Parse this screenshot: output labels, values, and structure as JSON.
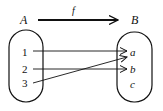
{
  "diagram": {
    "function_label": "f",
    "domain_label": "A",
    "codomain_label": "B",
    "domain_elements": [
      "1",
      "2",
      "3"
    ],
    "codomain_elements": [
      "a",
      "b",
      "c"
    ],
    "mappings": [
      {
        "from": "1",
        "to": "a"
      },
      {
        "from": "2",
        "to": "b"
      },
      {
        "from": "3",
        "to": "a"
      }
    ]
  }
}
